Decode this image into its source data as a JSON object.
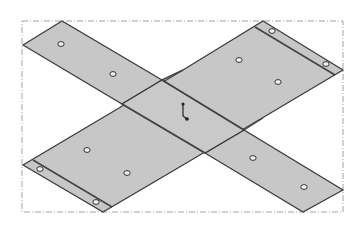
{
  "figure": {
    "type": "isometric sheet-metal flat pattern (cross shape)",
    "colors": {
      "background": "#ffffff",
      "panel_fill": "#c7c7c7",
      "edge": "#3a3a3a",
      "fold_line": "#555555",
      "frame": "#8a8a8a",
      "hole": "#ffffff"
    },
    "bounding_frame": {
      "x1": 22,
      "y1": 21,
      "x2": 343,
      "y2": 212,
      "style": "dash-dot"
    },
    "panels": [
      {
        "name": "top-left-strip",
        "points": "62,21 23,45 122,104 162,80"
      },
      {
        "name": "bottom-right-strip",
        "points": "244,130 205,153 303,212 343,190"
      },
      {
        "name": "main-diagonal-band",
        "points": "263,21 103,212 23,165 183,-0 183,0"
      }
    ],
    "holes": [
      {
        "cx": 61,
        "cy": 44
      },
      {
        "cx": 113,
        "cy": 74
      },
      {
        "cx": 272,
        "cy": 31
      },
      {
        "cx": 326,
        "cy": 64
      },
      {
        "cx": 239,
        "cy": 60
      },
      {
        "cx": 278,
        "cy": 82
      },
      {
        "cx": 87,
        "cy": 150
      },
      {
        "cx": 127,
        "cy": 173
      },
      {
        "cx": 40,
        "cy": 169
      },
      {
        "cx": 96,
        "cy": 202
      },
      {
        "cx": 253,
        "cy": 158
      },
      {
        "cx": 304,
        "cy": 187
      }
    ],
    "axis_indicator": {
      "x": 183,
      "y": 112
    }
  }
}
